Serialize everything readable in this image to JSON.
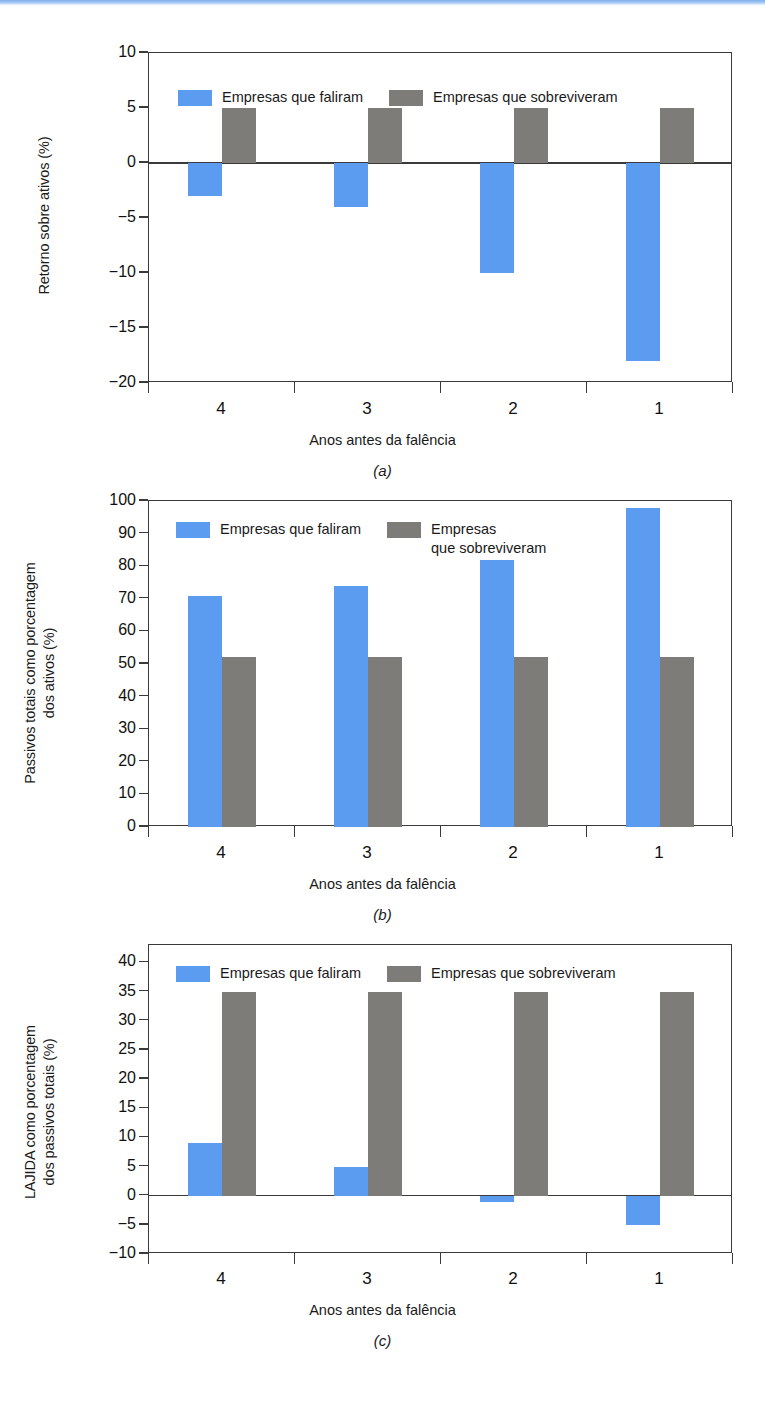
{
  "legend": {
    "failed_label": "Empresas que faliram",
    "survived_label": "Empresas que sobreviveram",
    "survived_label_wrapped": "Empresas\nque sobreviveram"
  },
  "colors": {
    "failed": "#5b9bf0",
    "survived": "#7e7c79",
    "axis": "#3a3a3a",
    "top_strip": "#7dafee"
  },
  "shared": {
    "xlabel": "Anos antes da falência",
    "categories": [
      "4",
      "3",
      "2",
      "1"
    ]
  },
  "captions": {
    "a": "(a)",
    "b": "(b)",
    "c": "(c)"
  },
  "panel_a": {
    "ylabel": "Retorno sobre ativos (%)",
    "yticks": [
      "10",
      "5",
      "0",
      "−5",
      "−10",
      "−15",
      "−20"
    ]
  },
  "panel_b": {
    "ylabel": "Passivos totais como porcentagem\ndos ativos (%)",
    "yticks": [
      "100",
      "90",
      "80",
      "70",
      "60",
      "50",
      "40",
      "30",
      "20",
      "10",
      "0"
    ]
  },
  "panel_c": {
    "ylabel": "LAJIDA como porcentagem\ndos passivos totais (%)",
    "yticks": [
      "40",
      "35",
      "30",
      "25",
      "20",
      "15",
      "10",
      "5",
      "0",
      "−5",
      "−10"
    ]
  },
  "chart_data": [
    {
      "type": "bar",
      "panel": "a",
      "title": "",
      "xlabel": "Anos antes da falência",
      "ylabel": "Retorno sobre ativos (%)",
      "categories": [
        "4",
        "3",
        "2",
        "1"
      ],
      "ylim": [
        -20,
        10
      ],
      "ytick_values": [
        10,
        5,
        0,
        -5,
        -10,
        -15,
        -20
      ],
      "grid": false,
      "legend_position": "top-inside",
      "series": [
        {
          "name": "Empresas que faliram",
          "color": "#5b9bf0",
          "values": [
            -3,
            -4,
            -10,
            -18
          ]
        },
        {
          "name": "Empresas que sobreviveram",
          "color": "#7e7c79",
          "values": [
            5,
            5,
            5,
            5
          ]
        }
      ]
    },
    {
      "type": "bar",
      "panel": "b",
      "title": "",
      "xlabel": "Anos antes da falência",
      "ylabel": "Passivos totais como porcentagem dos ativos (%)",
      "categories": [
        "4",
        "3",
        "2",
        "1"
      ],
      "ylim": [
        0,
        100
      ],
      "ytick_values": [
        100,
        90,
        80,
        70,
        60,
        50,
        40,
        30,
        20,
        10,
        0
      ],
      "grid": false,
      "legend_position": "top-inside",
      "series": [
        {
          "name": "Empresas que faliram",
          "color": "#5b9bf0",
          "values": [
            71,
            74,
            82,
            98
          ]
        },
        {
          "name": "Empresas que sobreviveram",
          "color": "#7e7c79",
          "values": [
            52,
            52,
            52,
            52
          ]
        }
      ]
    },
    {
      "type": "bar",
      "panel": "c",
      "title": "",
      "xlabel": "Anos antes da falência",
      "ylabel": "LAJIDA como porcentagem dos passivos totais (%)",
      "categories": [
        "4",
        "3",
        "2",
        "1"
      ],
      "ylim": [
        -10,
        43
      ],
      "ytick_values": [
        40,
        35,
        30,
        25,
        20,
        15,
        10,
        5,
        0,
        -5,
        -10
      ],
      "grid": false,
      "legend_position": "top-inside",
      "series": [
        {
          "name": "Empresas que faliram",
          "color": "#5b9bf0",
          "values": [
            9,
            5,
            -1,
            -5
          ]
        },
        {
          "name": "Empresas que sobreviveram",
          "color": "#7e7c79",
          "values": [
            35,
            35,
            35,
            35
          ]
        }
      ]
    }
  ]
}
